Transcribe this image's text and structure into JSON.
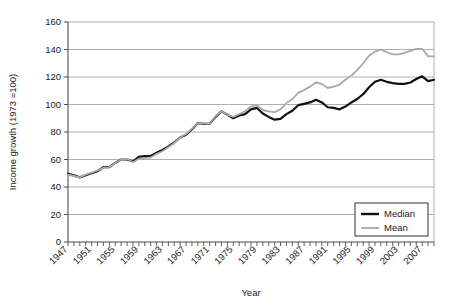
{
  "chart_data": {
    "type": "line",
    "title": "",
    "xlabel": "Year",
    "ylabel": "Income growth (1973 =100)",
    "xlim": [
      1947,
      2009
    ],
    "ylim": [
      0,
      160
    ],
    "ytick_step": 20,
    "yticks": [
      0,
      20,
      40,
      60,
      80,
      100,
      120,
      140,
      160
    ],
    "xticks_labeled": [
      1947,
      1951,
      1955,
      1959,
      1963,
      1967,
      1971,
      1975,
      1979,
      1983,
      1987,
      1991,
      1995,
      1999,
      2003,
      2007
    ],
    "xtick_every": 1,
    "grid": "horizontal",
    "legend_position": "bottom-right",
    "x": [
      1947,
      1948,
      1949,
      1950,
      1951,
      1952,
      1953,
      1954,
      1955,
      1956,
      1957,
      1958,
      1959,
      1960,
      1961,
      1962,
      1963,
      1964,
      1965,
      1966,
      1967,
      1968,
      1969,
      1970,
      1971,
      1972,
      1973,
      1974,
      1975,
      1976,
      1977,
      1978,
      1979,
      1980,
      1981,
      1982,
      1983,
      1984,
      1985,
      1986,
      1987,
      1988,
      1989,
      1990,
      1991,
      1992,
      1993,
      1994,
      1995,
      1996,
      1997,
      1998,
      1999,
      2000,
      2001,
      2002,
      2003,
      2004,
      2005,
      2006,
      2007,
      2008,
      2009
    ],
    "series": [
      {
        "name": "Median",
        "color": "#111111",
        "values": [
          49.5,
          48.5,
          47.0,
          48.5,
          50.0,
          51.5,
          54.5,
          54.5,
          57.5,
          60.0,
          60.0,
          58.5,
          62.0,
          62.5,
          62.5,
          65.0,
          67.0,
          69.5,
          72.5,
          76.0,
          78.0,
          82.0,
          86.5,
          86.0,
          86.0,
          91.0,
          95.0,
          92.5,
          90.0,
          92.0,
          93.0,
          96.5,
          97.5,
          93.5,
          91.0,
          89.0,
          89.5,
          93.0,
          95.5,
          99.5,
          100.5,
          101.5,
          103.5,
          101.5,
          98.0,
          97.5,
          96.5,
          98.5,
          101.5,
          104.0,
          107.5,
          112.5,
          116.5,
          118.0,
          116.5,
          115.5,
          115.0,
          115.0,
          116.0,
          118.5,
          120.5,
          117.0,
          118.0
        ]
      },
      {
        "name": "Mean",
        "color": "#a8a8a8",
        "values": [
          49.0,
          48.0,
          47.0,
          49.0,
          50.5,
          52.0,
          54.0,
          54.5,
          57.5,
          60.0,
          60.5,
          58.0,
          60.5,
          61.0,
          61.5,
          64.0,
          66.0,
          69.0,
          72.0,
          76.0,
          78.5,
          82.5,
          86.5,
          86.5,
          86.0,
          91.5,
          95.0,
          92.5,
          91.0,
          93.0,
          95.0,
          98.5,
          99.5,
          96.0,
          95.0,
          94.5,
          96.5,
          101.0,
          104.0,
          108.5,
          110.5,
          113.0,
          116.0,
          115.0,
          112.0,
          113.0,
          114.5,
          118.0,
          121.0,
          125.0,
          130.0,
          135.5,
          138.5,
          140.0,
          138.0,
          136.5,
          136.5,
          137.5,
          139.0,
          140.5,
          140.5,
          135.0,
          135.0
        ]
      }
    ]
  },
  "legend": {
    "items": [
      {
        "label": "Median",
        "color": "#111111"
      },
      {
        "label": "Mean",
        "color": "#a8a8a8"
      }
    ]
  },
  "axes": {
    "x_title": "Year",
    "y_title": "Income growth (1973 =100)"
  }
}
